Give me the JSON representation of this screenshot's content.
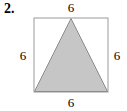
{
  "figure": {
    "problem_number": "2.",
    "shape_outer": "square",
    "shape_inner": "triangle",
    "labels": {
      "top": "6",
      "right": "6",
      "bottom": "6",
      "left": "6"
    },
    "colors": {
      "background": "#ffffff",
      "square_stroke": "#9a9a9a",
      "triangle_fill": "#c6c6c6",
      "triangle_stroke": "#8c8c8c",
      "text": "#000000"
    },
    "geometry": {
      "square_left": 34,
      "square_top": 18,
      "square_size": 74,
      "triangle_apex_x": 71,
      "triangle_apex_y": 19,
      "triangle_base_y": 92
    }
  }
}
